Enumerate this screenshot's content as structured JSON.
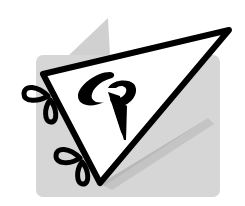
{
  "logo": {
    "monogram": "CP",
    "description": "pennant-flag-logo"
  },
  "colors": {
    "background": "#ffffff",
    "panel_gray": "#d4d4d4",
    "panel_peak_gray": "#cfcfcf",
    "shadow_gray": "#b4b4b4",
    "ink": "#000000",
    "pennant_fill": "#ffffff"
  }
}
